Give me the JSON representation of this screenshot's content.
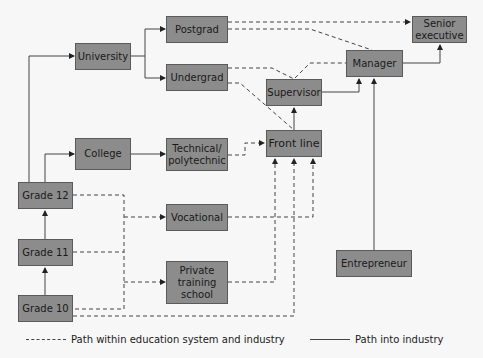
{
  "diagram": {
    "nodes": {
      "university": "University",
      "postgrad": "Postgrad",
      "undergrad": "Undergrad",
      "college": "College",
      "technical": "Technical/ polytechnic",
      "front_line": "Front line",
      "supervisor": "Supervisor",
      "manager": "Manager",
      "senior_executive": "Senior executive",
      "grade12": "Grade 12",
      "grade11": "Grade 11",
      "grade10": "Grade 10",
      "vocational": "Vocational",
      "private_training": "Private training school",
      "entrepreneur": "Entrepreneur"
    },
    "edges_solid": [
      [
        "Grade 10",
        "Grade 11"
      ],
      [
        "Grade 11",
        "Grade 12"
      ],
      [
        "Grade 12",
        "University"
      ],
      [
        "Grade 12",
        "College"
      ],
      [
        "University",
        "Postgrad"
      ],
      [
        "University",
        "Undergrad"
      ],
      [
        "College",
        "Technical/ polytechnic"
      ],
      [
        "Front line",
        "Supervisor"
      ],
      [
        "Supervisor",
        "Manager"
      ],
      [
        "Manager",
        "Senior executive"
      ],
      [
        "Entrepreneur",
        "Manager"
      ]
    ],
    "edges_dashed": [
      [
        "Postgrad",
        "Senior executive"
      ],
      [
        "Postgrad",
        "Manager"
      ],
      [
        "Undergrad",
        "Supervisor"
      ],
      [
        "Undergrad",
        "Front line"
      ],
      [
        "Technical/ polytechnic",
        "Front line"
      ],
      [
        "Grade 12",
        "Vocational"
      ],
      [
        "Grade 11",
        "Vocational"
      ],
      [
        "Grade 10",
        "Private training school"
      ],
      [
        "Vocational",
        "Front line"
      ],
      [
        "Private training school",
        "Front line"
      ],
      [
        "Grade 10",
        "Front line"
      ],
      [
        "Supervisor",
        "Manager"
      ]
    ],
    "legend": {
      "dashed": "Path within education system and industry",
      "solid": "Path into industry"
    }
  }
}
